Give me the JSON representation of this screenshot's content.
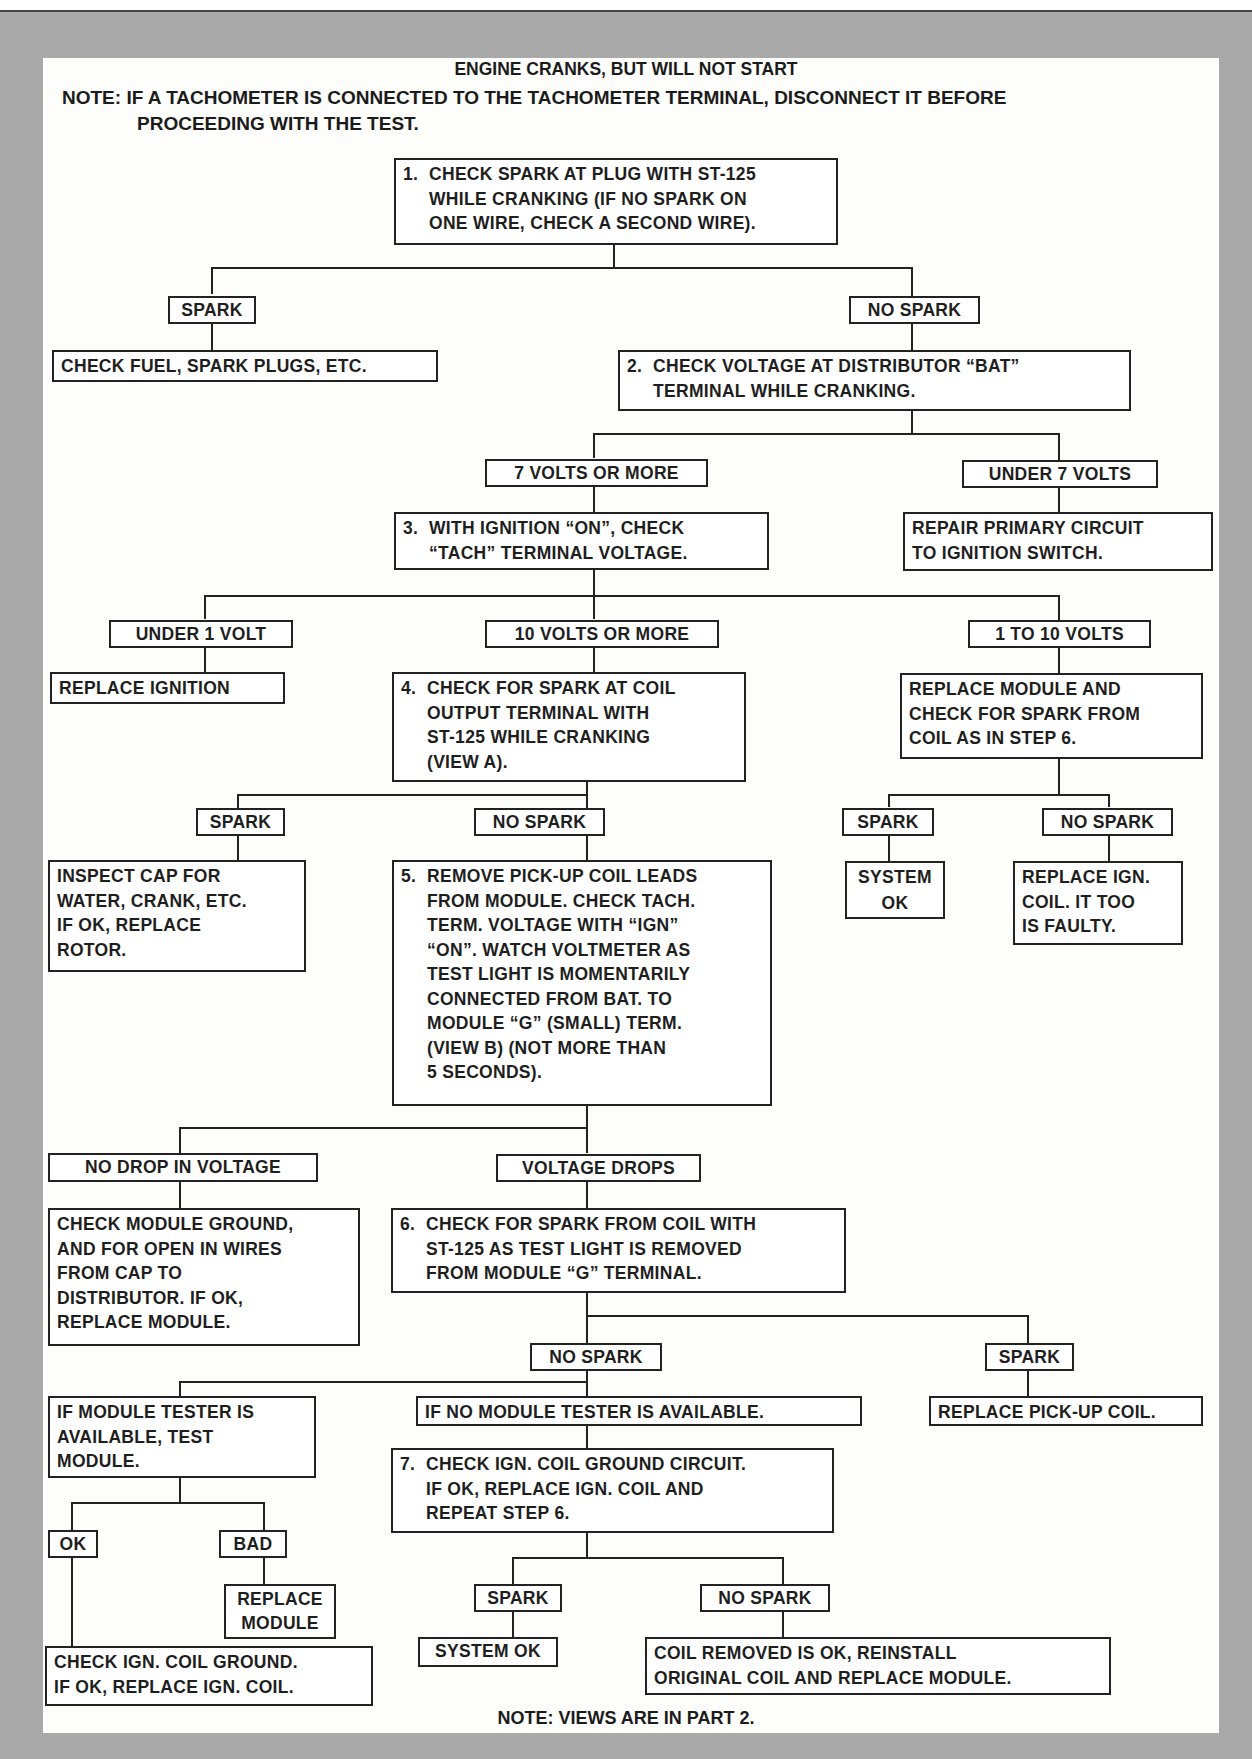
{
  "page_header": {
    "page_number": "166",
    "running_title": "MOTOR AUTOMOTIVE MECHANICS"
  },
  "title": "ENGINE CRANKS, BUT WILL NOT START",
  "note": {
    "line1": "NOTE: IF A TACHOMETER IS CONNECTED TO THE TACHOMETER TERMINAL, DISCONNECT IT BEFORE",
    "line2": "PROCEEDING WITH THE TEST."
  },
  "footer_note": "NOTE: VIEWS ARE IN PART 2.",
  "nodes": {
    "step1": {
      "num": "1.",
      "lines": [
        "CHECK SPARK AT PLUG WITH ST-125",
        "WHILE CRANKING (IF NO SPARK ON",
        "ONE WIRE, CHECK A SECOND WIRE)."
      ]
    },
    "s1_spark": {
      "label": "SPARK"
    },
    "s1_spark_result": {
      "lines": [
        "CHECK FUEL, SPARK PLUGS, ETC."
      ]
    },
    "s1_nospark": {
      "label": "NO SPARK"
    },
    "step2": {
      "num": "2.",
      "lines": [
        "CHECK VOLTAGE AT DISTRIBUTOR “BAT”",
        "TERMINAL WHILE CRANKING."
      ]
    },
    "s2_7plus": {
      "label": "7 VOLTS OR MORE"
    },
    "s2_under7": {
      "label": "UNDER 7 VOLTS"
    },
    "s2_under7_result": {
      "lines": [
        "REPAIR PRIMARY CIRCUIT",
        "TO IGNITION SWITCH."
      ]
    },
    "step3": {
      "num": "3.",
      "lines": [
        "WITH IGNITION “ON”, CHECK",
        "“TACH” TERMINAL VOLTAGE."
      ]
    },
    "s3_under1": {
      "label": "UNDER 1 VOLT"
    },
    "s3_under1_result": {
      "lines": [
        "REPLACE IGNITION"
      ]
    },
    "s3_10plus": {
      "label": "10 VOLTS OR MORE"
    },
    "s3_1to10": {
      "label": "1 TO 10 VOLTS"
    },
    "s3_1to10_result": {
      "lines": [
        "REPLACE MODULE AND",
        "CHECK FOR SPARK FROM",
        "COIL AS IN STEP 6."
      ]
    },
    "r_spark": {
      "label": "SPARK"
    },
    "r_spark_result": {
      "lines": [
        "SYSTEM",
        "OK"
      ]
    },
    "r_nospark": {
      "label": "NO SPARK"
    },
    "r_nospark_result": {
      "lines": [
        "REPLACE IGN.",
        "COIL. IT TOO",
        "IS FAULTY."
      ]
    },
    "step4": {
      "num": "4.",
      "lines": [
        "CHECK FOR SPARK AT COIL",
        "OUTPUT TERMINAL WITH",
        "ST-125 WHILE CRANKING",
        "(VIEW A)."
      ]
    },
    "s4_spark": {
      "label": "SPARK"
    },
    "s4_spark_result": {
      "lines": [
        "INSPECT CAP FOR",
        "WATER, CRANK, ETC.",
        "IF OK, REPLACE",
        "ROTOR."
      ]
    },
    "s4_nospark": {
      "label": "NO SPARK"
    },
    "step5": {
      "num": "5.",
      "lines": [
        "REMOVE PICK-UP COIL LEADS",
        "FROM MODULE. CHECK TACH.",
        "TERM. VOLTAGE WITH “IGN”",
        "“ON”. WATCH VOLTMETER AS",
        "TEST LIGHT IS MOMENTARILY",
        "CONNECTED FROM BAT. TO",
        "MODULE “G” (SMALL) TERM.",
        "(VIEW B) (NOT MORE THAN",
        "5 SECONDS)."
      ]
    },
    "s5_nodrop": {
      "label": "NO DROP IN VOLTAGE"
    },
    "s5_nodrop_result": {
      "lines": [
        "CHECK MODULE GROUND,",
        "AND FOR OPEN IN WIRES",
        "FROM CAP TO",
        "DISTRIBUTOR. IF OK,",
        "REPLACE MODULE."
      ]
    },
    "s5_drops": {
      "label": "VOLTAGE DROPS"
    },
    "step6": {
      "num": "6.",
      "lines": [
        "CHECK FOR SPARK FROM COIL WITH",
        "ST-125 AS TEST LIGHT IS REMOVED",
        "FROM MODULE “G” TERMINAL."
      ]
    },
    "s6_nospark": {
      "label": "NO SPARK"
    },
    "s6_spark": {
      "label": "SPARK"
    },
    "s6_spark_result": {
      "lines": [
        "REPLACE PICK-UP COIL."
      ]
    },
    "tester_yes": {
      "lines": [
        "IF MODULE TESTER IS",
        "AVAILABLE, TEST",
        "MODULE."
      ]
    },
    "tester_no": {
      "lines": [
        "IF NO MODULE TESTER IS AVAILABLE."
      ]
    },
    "t_ok": {
      "label": "OK"
    },
    "t_bad": {
      "label": "BAD"
    },
    "t_bad_result": {
      "lines": [
        "REPLACE",
        "MODULE"
      ]
    },
    "t_ok_result": {
      "lines": [
        "CHECK IGN. COIL GROUND.",
        "IF OK, REPLACE IGN. COIL."
      ]
    },
    "step7": {
      "num": "7.",
      "lines": [
        "CHECK IGN. COIL GROUND CIRCUIT.",
        "IF OK, REPLACE IGN. COIL AND",
        "REPEAT STEP  6."
      ]
    },
    "s7_spark": {
      "label": "SPARK"
    },
    "s7_spark_result": {
      "lines": [
        "SYSTEM OK"
      ]
    },
    "s7_nospark": {
      "label": "NO SPARK"
    },
    "s7_nospark_result": {
      "lines": [
        "COIL REMOVED IS OK, REINSTALL",
        "ORIGINAL COIL AND REPLACE MODULE."
      ]
    }
  }
}
